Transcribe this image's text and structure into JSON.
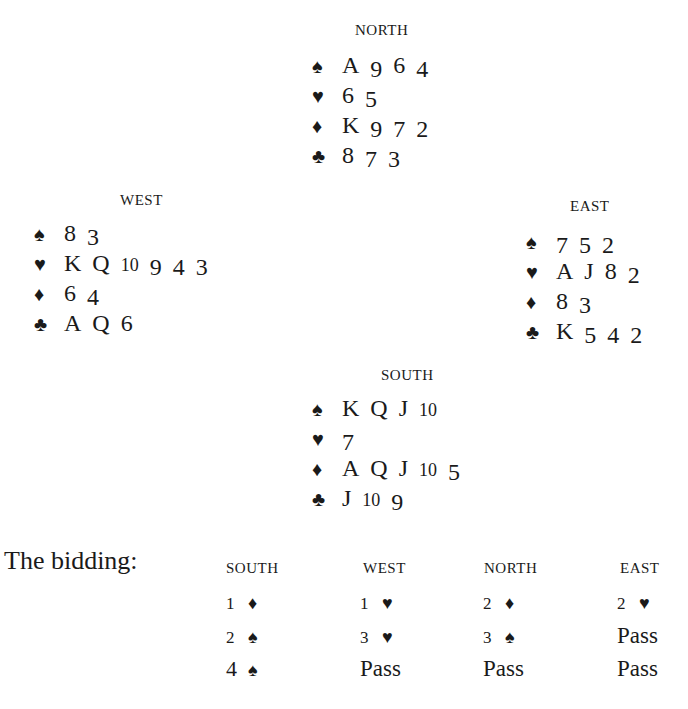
{
  "hands": {
    "north": {
      "title": "NORTH",
      "spades": [
        "A",
        "9",
        "6",
        "4"
      ],
      "hearts": [
        "6",
        "5"
      ],
      "diamonds": [
        "K",
        "9",
        "7",
        "2"
      ],
      "clubs": [
        "8",
        "7",
        "3"
      ]
    },
    "west": {
      "title": "WEST",
      "spades": [
        "8",
        "3"
      ],
      "hearts": [
        "K",
        "Q",
        "10",
        "9",
        "4",
        "3"
      ],
      "diamonds": [
        "6",
        "4"
      ],
      "clubs": [
        "A",
        "Q",
        "6"
      ]
    },
    "east": {
      "title": "EAST",
      "spades": [
        "7",
        "5",
        "2"
      ],
      "hearts": [
        "A",
        "J",
        "8",
        "2"
      ],
      "diamonds": [
        "8",
        "3"
      ],
      "clubs": [
        "K",
        "5",
        "4",
        "2"
      ]
    },
    "south": {
      "title": "SOUTH",
      "spades": [
        "K",
        "Q",
        "J",
        "10"
      ],
      "hearts": [
        "7"
      ],
      "diamonds": [
        "A",
        "Q",
        "J",
        "10",
        "5"
      ],
      "clubs": [
        "J",
        "10",
        "9"
      ]
    }
  },
  "suit_icons": {
    "spades": "♠",
    "hearts": "♥",
    "diamonds": "♦",
    "clubs": "♣"
  },
  "bidding": {
    "label": "The bidding:",
    "headers": [
      "SOUTH",
      "WEST",
      "NORTH",
      "EAST"
    ],
    "rounds": [
      [
        {
          "level": "1",
          "suit": "♦"
        },
        {
          "level": "1",
          "suit": "♥"
        },
        {
          "level": "2",
          "suit": "♦"
        },
        {
          "level": "2",
          "suit": "♥"
        }
      ],
      [
        {
          "level": "2",
          "suit": "♠"
        },
        {
          "level": "3",
          "suit": "♥"
        },
        {
          "level": "3",
          "suit": "♠"
        },
        {
          "text": "Pass"
        }
      ],
      [
        {
          "level": "4",
          "suit": "♠"
        },
        {
          "text": "Pass"
        },
        {
          "text": "Pass"
        },
        {
          "text": "Pass"
        }
      ]
    ]
  }
}
